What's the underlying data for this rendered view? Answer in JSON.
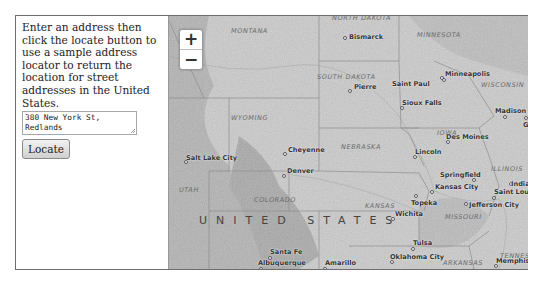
{
  "panel": {
    "instructions": "Enter an address then click the locate button to use a sample address locator to return the location for street addresses in the United States.",
    "address_value": "380 New York St, Redlands",
    "locate_label": "Locate"
  },
  "map": {
    "zoom_in": "+",
    "zoom_out": "−",
    "country_label": "UNITED STATES",
    "states": [
      {
        "name": "MONTANA",
        "x": 62,
        "y": 11
      },
      {
        "name": "NORTH DAKOTA",
        "x": 163,
        "y": -2
      },
      {
        "name": "MINNESOTA",
        "x": 248,
        "y": 15
      },
      {
        "name": "SOUTH DAKOTA",
        "x": 148,
        "y": 57
      },
      {
        "name": "WISCONSIN",
        "x": 312,
        "y": 65
      },
      {
        "name": "WYOMING",
        "x": 62,
        "y": 98
      },
      {
        "name": "IOWA",
        "x": 268,
        "y": 113
      },
      {
        "name": "NEBRASKA",
        "x": 172,
        "y": 127
      },
      {
        "name": "ILLINOIS",
        "x": 322,
        "y": 149
      },
      {
        "name": "UTAH",
        "x": 10,
        "y": 170
      },
      {
        "name": "COLORADO",
        "x": 85,
        "y": 180
      },
      {
        "name": "KANSAS",
        "x": 196,
        "y": 186
      },
      {
        "name": "MISSOURI",
        "x": 276,
        "y": 197
      },
      {
        "name": "ARKANSAS",
        "x": 274,
        "y": 243
      },
      {
        "name": "TENNESSEE",
        "x": 331,
        "y": 236
      }
    ],
    "cities": [
      {
        "name": "Bismarck",
        "x": 176,
        "y": 22,
        "lx": 4,
        "ly": -5
      },
      {
        "name": "Minneapolis",
        "x": 273,
        "y": 62,
        "lx": 3,
        "ly": -8
      },
      {
        "name": "Saint Paul",
        "x": 275,
        "y": 64,
        "lx": -52,
        "ly": 0
      },
      {
        "name": "Pierre",
        "x": 181,
        "y": 75,
        "lx": 4,
        "ly": -8
      },
      {
        "name": "Sioux Falls",
        "x": 233,
        "y": 92,
        "lx": 0,
        "ly": -9
      },
      {
        "name": "Madison",
        "x": 336,
        "y": 101,
        "lx": -10,
        "ly": -10
      },
      {
        "name": "Gran",
        "x": 357,
        "y": 102,
        "lx": -3,
        "ly": 3
      },
      {
        "name": "Des Moines",
        "x": 279,
        "y": 126,
        "lx": -2,
        "ly": -9
      },
      {
        "name": "Cheyenne",
        "x": 116,
        "y": 138,
        "lx": 3,
        "ly": -8
      },
      {
        "name": "Lincoln",
        "x": 246,
        "y": 141,
        "lx": 0,
        "ly": -9
      },
      {
        "name": "Salt Lake City",
        "x": 17,
        "y": 146,
        "lx": 0,
        "ly": -8
      },
      {
        "name": "Denver",
        "x": 115,
        "y": 160,
        "lx": 3,
        "ly": -9
      },
      {
        "name": "Springfield",
        "x": 305,
        "y": 164,
        "lx": -34,
        "ly": -9
      },
      {
        "name": "Indian",
        "x": 342,
        "y": 168,
        "lx": 0,
        "ly": -4
      },
      {
        "name": "Kansas City",
        "x": 263,
        "y": 176,
        "lx": 3,
        "ly": -9
      },
      {
        "name": "Topeka",
        "x": 247,
        "y": 180,
        "lx": -5,
        "ly": 3
      },
      {
        "name": "Saint Louis",
        "x": 325,
        "y": 182,
        "lx": 0,
        "ly": -10
      },
      {
        "name": "Jefferson City",
        "x": 297,
        "y": 188,
        "lx": 3,
        "ly": -3
      },
      {
        "name": "Wichita",
        "x": 224,
        "y": 203,
        "lx": 2,
        "ly": -9
      },
      {
        "name": "Santa Fe",
        "x": 101,
        "y": 242,
        "lx": 0,
        "ly": -10
      },
      {
        "name": "Albuquerque",
        "x": 92,
        "y": 253,
        "lx": -3,
        "ly": -10
      },
      {
        "name": "Amarillo",
        "x": 156,
        "y": 253,
        "lx": 0,
        "ly": -10
      },
      {
        "name": "Tulsa",
        "x": 244,
        "y": 233,
        "lx": 0,
        "ly": -10
      },
      {
        "name": "Oklahoma City",
        "x": 223,
        "y": 246,
        "lx": -2,
        "ly": -9
      },
      {
        "name": "Memphis",
        "x": 327,
        "y": 250,
        "lx": 0,
        "ly": -9
      }
    ]
  }
}
